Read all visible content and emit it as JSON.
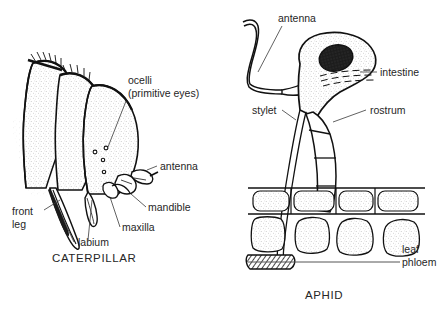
{
  "figure": {
    "background_color": "#ffffff",
    "ink_color": "#111111",
    "text_color": "#262626",
    "panels": [
      {
        "id": "caterpillar",
        "caption": "CATERPILLAR"
      },
      {
        "id": "aphid",
        "caption": "APHID"
      }
    ]
  },
  "caterpillar": {
    "caption": "CATERPILLAR",
    "labels": {
      "ocelli_line1": "ocelli",
      "ocelli_line2": "(primitive eyes)",
      "antenna": "antenna",
      "mandible": "mandible",
      "maxilla": "maxilla",
      "labium": "labium",
      "front_leg_line1": "front",
      "front_leg_line2": "leg"
    },
    "ocelli_count": 4
  },
  "aphid": {
    "caption": "APHID",
    "labels": {
      "antenna": "antenna",
      "intestine": "intestine",
      "stylet": "stylet",
      "rostrum": "rostrum",
      "leaf_line1": "leaf",
      "leaf_line2": "phloem"
    },
    "leaf": {
      "epidermis_cell_count": 4,
      "mesophyll_cell_count": 4
    },
    "eye_color": "#1c1c1c"
  }
}
